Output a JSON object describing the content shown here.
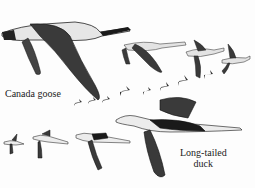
{
  "illustration": {
    "subject": "birds in flight",
    "labels": {
      "canada_goose": "Canada goose",
      "long_tailed_duck_line1": "Long-tailed",
      "long_tailed_duck_line2": "duck"
    },
    "colors": {
      "background": "#fdfdfd",
      "ink": "#222222",
      "wing": "#3a3a3a",
      "body": "#e8e8e8"
    }
  }
}
